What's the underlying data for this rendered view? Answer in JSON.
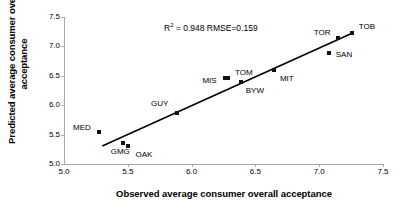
{
  "chart_data": {
    "type": "scatter",
    "title": "",
    "xlabel": "Observed average consumer overall acceptance",
    "ylabel": "Predicted average consumer overall acceptance",
    "xlim": [
      5.0,
      7.5
    ],
    "ylim": [
      5.0,
      7.5
    ],
    "xticks": [
      "5.0",
      "5.5",
      "6.0",
      "6.5",
      "7.0",
      "7.5"
    ],
    "yticks": [
      "5.0",
      "5.5",
      "6.0",
      "6.5",
      "7.0",
      "7.5"
    ],
    "xtick_values": [
      5.0,
      5.5,
      6.0,
      6.5,
      7.0,
      7.5
    ],
    "ytick_values": [
      5.0,
      5.5,
      6.0,
      6.5,
      7.0,
      7.5
    ],
    "grid": false,
    "legend": "none",
    "marker_color": "#111111",
    "line_color": "#000000",
    "annotations": [
      {
        "name": "r2-rmse-annotation",
        "text_r2_prefix": "R",
        "text_r2_sup": "2",
        "text_rest": " = 0.948  RMSE=0.159",
        "r2": 0.948,
        "rmse": 0.159,
        "x": 6.27,
        "y": 7.33
      }
    ],
    "fit_line": {
      "name": "regression-line",
      "x_start": 5.3,
      "y_start": 5.305,
      "x_end": 7.27,
      "y_end": 7.235
    },
    "points": [
      {
        "label": "MED",
        "x": 5.275,
        "y": 5.545,
        "label_dx": -26,
        "label_dy": -4
      },
      {
        "label": "GMG",
        "x": 5.46,
        "y": 5.355,
        "label_dx": -12,
        "label_dy": 9
      },
      {
        "label": "OAK",
        "x": 5.505,
        "y": 5.3,
        "label_dx": 7,
        "label_dy": 9
      },
      {
        "label": "GUY",
        "x": 5.885,
        "y": 5.875,
        "label_dx": -26,
        "label_dy": -9
      },
      {
        "label": "MIS",
        "x": 6.265,
        "y": 6.47,
        "label_dx": -23,
        "label_dy": 3
      },
      {
        "label": "TOM",
        "x": 6.285,
        "y": 6.47,
        "label_dx": 7,
        "label_dy": -5
      },
      {
        "label": "BYW",
        "x": 6.385,
        "y": 6.39,
        "label_dx": 5,
        "label_dy": 9
      },
      {
        "label": "MIT",
        "x": 6.645,
        "y": 6.605,
        "label_dx": 6,
        "label_dy": 9
      },
      {
        "label": "TOR",
        "x": 7.145,
        "y": 7.15,
        "label_dx": -24,
        "label_dy": -5
      },
      {
        "label": "SAN",
        "x": 7.075,
        "y": 6.88,
        "label_dx": 7,
        "label_dy": 2
      },
      {
        "label": "TOB",
        "x": 7.255,
        "y": 7.22,
        "label_dx": 7,
        "label_dy": -6
      }
    ]
  }
}
